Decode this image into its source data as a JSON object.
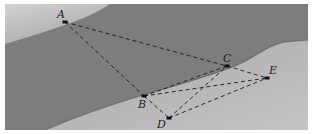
{
  "figure": {
    "type": "geometry-diagram",
    "colors": {
      "water": "#7d7d7d",
      "far_bank": "#bdbdbd",
      "near_bank": "#b8b8b8",
      "line": "#1a1a1a"
    },
    "points": {
      "A": {
        "label": "A",
        "x": 65,
        "y": 22
      },
      "B": {
        "label": "B",
        "x": 144,
        "y": 96
      },
      "C": {
        "label": "C",
        "x": 227,
        "y": 66
      },
      "D": {
        "label": "D",
        "x": 169,
        "y": 118
      },
      "E": {
        "label": "E",
        "x": 267,
        "y": 78
      }
    },
    "segments": [
      [
        "A",
        "C"
      ],
      [
        "A",
        "B"
      ],
      [
        "B",
        "C"
      ],
      [
        "B",
        "E"
      ],
      [
        "B",
        "D"
      ],
      [
        "D",
        "C"
      ],
      [
        "D",
        "E"
      ],
      [
        "C",
        "E"
      ]
    ]
  }
}
